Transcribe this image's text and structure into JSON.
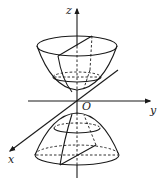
{
  "diagram": {
    "type": "3d-coordinate-surface",
    "axes": {
      "x_label": "x",
      "y_label": "y",
      "z_label": "z",
      "origin_label": "O"
    },
    "surfaces": [
      {
        "name": "upper-paraboloid",
        "opens": "up"
      },
      {
        "name": "lower-paraboloid",
        "opens": "down"
      }
    ],
    "colors": {
      "line": "#1a1a1a",
      "background": "#ffffff"
    }
  }
}
